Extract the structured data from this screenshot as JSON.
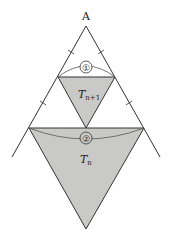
{
  "diagram": {
    "vertex_label": "A",
    "arc_labels": [
      "①",
      "②"
    ],
    "region_labels": [
      {
        "main": "T",
        "sub": "n+1"
      },
      {
        "main": "T",
        "sub": "n"
      }
    ],
    "colors": {
      "fill": "#c9c9c7",
      "stroke": "#333333",
      "arc": "#555555",
      "text": "#222222"
    }
  }
}
